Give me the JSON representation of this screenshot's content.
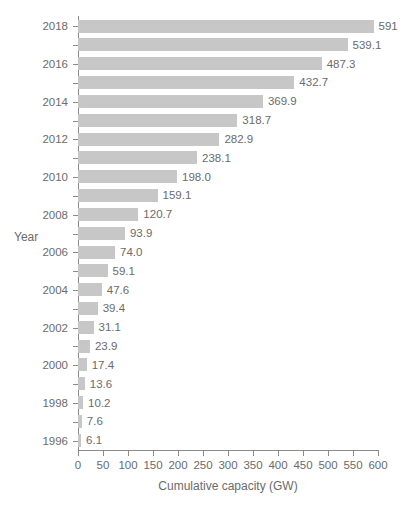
{
  "chart_data": {
    "type": "bar",
    "orientation": "horizontal",
    "title": "",
    "xlabel": "Cumulative capacity (GW)",
    "ylabel": "Year",
    "xlim": [
      0,
      600
    ],
    "grid": false,
    "legend": false,
    "bar_color": "#c7c7c7",
    "text_color": "#6b6b6b",
    "axis_color": "#8a8a8a",
    "xticks": [
      0,
      50,
      100,
      150,
      200,
      250,
      300,
      350,
      400,
      450,
      500,
      550,
      600
    ],
    "xtick_labels": [
      "0",
      "50",
      "100",
      "150",
      "200",
      "250",
      "300",
      "350",
      "400",
      "450",
      "500",
      "550",
      "600"
    ],
    "ytick_labels": [
      "2018",
      "2016",
      "2014",
      "2012",
      "2010",
      "2008",
      "2006",
      "2004",
      "2002",
      "2000",
      "1998",
      "1996"
    ],
    "categories": [
      "2018",
      "2017",
      "2016",
      "2015",
      "2014",
      "2013",
      "2012",
      "2011",
      "2010",
      "2009",
      "2008",
      "2007",
      "2006",
      "2005",
      "2004",
      "2003",
      "2002",
      "2001",
      "2000",
      "1999",
      "1998",
      "1997",
      "1996"
    ],
    "values": [
      591,
      539.1,
      487.3,
      432.7,
      369.9,
      318.7,
      282.9,
      238.1,
      198.0,
      159.1,
      120.7,
      93.9,
      74.0,
      59.1,
      47.6,
      39.4,
      31.1,
      23.9,
      17.4,
      13.6,
      10.2,
      7.6,
      6.1
    ],
    "data_labels": [
      "591",
      "539.1",
      "487.3",
      "432.7",
      "369.9",
      "318.7",
      "282.9",
      "238.1",
      "198.0",
      "159.1",
      "120.7",
      "93.9",
      "74.0",
      "59.1",
      "47.6",
      "39.4",
      "31.1",
      "23.9",
      "17.4",
      "13.6",
      "10.2",
      "7.6",
      "6.1"
    ],
    "labeled_years": [
      "2018",
      "",
      "2016",
      "",
      "2014",
      "",
      "2012",
      "",
      "2010",
      "",
      "2008",
      "",
      "2006",
      "",
      "2004",
      "",
      "2002",
      "",
      "2000",
      "",
      "1998",
      "",
      "1996"
    ]
  }
}
